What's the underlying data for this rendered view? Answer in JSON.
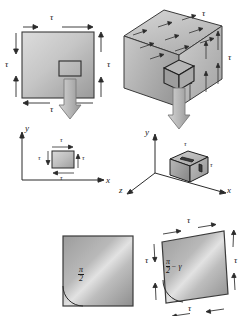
{
  "figure": {
    "symbols": {
      "tau": "τ",
      "gamma": "γ",
      "pi": "π",
      "two": "2",
      "minus": "−"
    },
    "colors": {
      "face_light": "#d8d8d8",
      "face_mid": "#bdbdbd",
      "face_dark": "#8f8f8f",
      "outline": "#3a3a3a",
      "arrow_fill": "#c9c9c9",
      "arrow_stroke": "#6a6a6a",
      "text": "#1a1a1a"
    }
  },
  "panel_top_left": {
    "name": "2D block with shear stress",
    "edge_labels": {
      "top": "τ",
      "right": "τ",
      "bottom": "τ",
      "left": "τ"
    }
  },
  "panel_mid_left": {
    "name": "2D stress element with xy axes",
    "axis_x": "x",
    "axis_y": "y",
    "edge_labels": {
      "top": "τ",
      "right": "τ",
      "bottom": "τ",
      "left": "τ"
    }
  },
  "panel_top_right": {
    "name": "3D cube with shear stress",
    "edge_labels": {
      "top": "τ",
      "right": "τ"
    }
  },
  "panel_mid_right": {
    "name": "3D stress element with xyz axes",
    "axis_x": "x",
    "axis_y": "y",
    "axis_z": "z",
    "edge_labels": {
      "top": "τ",
      "right": "τ"
    }
  },
  "panel_bottom_left": {
    "name": "Undeformed element right angle",
    "angle_num": "π",
    "angle_den": "2"
  },
  "panel_bottom_right": {
    "name": "Sheared element with strain gamma",
    "angle_num": "π",
    "angle_den": "2",
    "angle_tail": "− γ",
    "edge_labels": {
      "top": "τ",
      "right": "τ",
      "bottom": "τ",
      "left": "τ"
    }
  }
}
